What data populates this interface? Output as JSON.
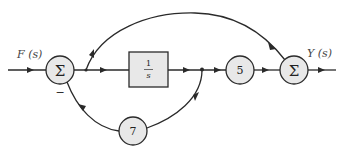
{
  "diagram": {
    "type": "block-diagram",
    "input_label": "F (s)",
    "output_label": "Y (s)",
    "summing_junction_symbol": "Σ",
    "sum1": {
      "symbol": "Σ",
      "feedback_sign": "−"
    },
    "sum2": {
      "symbol": "Σ"
    },
    "integrator": {
      "numerator": "1",
      "denominator": "s"
    },
    "gain_forward": "5",
    "gain_feedback": "7",
    "colors": {
      "line": "#2a2a2a",
      "node_fill": "#e8e8e8",
      "background": "#ffffff"
    },
    "connections": [
      {
        "from": "F(s)",
        "to": "sum1"
      },
      {
        "from": "sum1",
        "to": "integrator"
      },
      {
        "from": "sum1",
        "to": "sum2",
        "path": "feedforward-arc"
      },
      {
        "from": "integrator",
        "to": "gain_forward"
      },
      {
        "from": "integrator",
        "to": "gain_feedback"
      },
      {
        "from": "gain_feedback",
        "to": "sum1",
        "sign": "-"
      },
      {
        "from": "gain_forward",
        "to": "sum2"
      },
      {
        "from": "sum2",
        "to": "Y(s)"
      }
    ]
  }
}
